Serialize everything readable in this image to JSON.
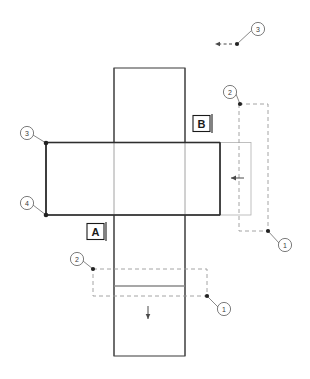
{
  "drawing": {
    "title": "Sheet metal cross flat pattern with bend zones",
    "background_color": "#ffffff",
    "line_color": "#4a4a4a",
    "heavy_line_color": "#2e2e2e",
    "light_line_color": "#a8a8a8",
    "dashed_line_color": "#9a9a9a",
    "balloon_color": "#5a5a5a",
    "width": 310,
    "height": 379
  },
  "datums": [
    {
      "id": "datum-a",
      "label": "A",
      "x": 96,
      "y": 232
    },
    {
      "id": "datum-b",
      "label": "B",
      "x": 202,
      "y": 124
    }
  ],
  "balloons": [
    {
      "id": "balloon-top-3",
      "label": "3",
      "cx": 258,
      "cy": 29,
      "dot_x": 237,
      "dot_y": 44
    },
    {
      "id": "balloon-right-2",
      "label": "2",
      "cx": 230,
      "cy": 92,
      "dot_x": 240,
      "dot_y": 104
    },
    {
      "id": "balloon-right-1",
      "label": "1",
      "cx": 285,
      "cy": 245,
      "dot_x": 268,
      "dot_y": 231
    },
    {
      "id": "balloon-left-3",
      "label": "3",
      "cx": 27,
      "cy": 133,
      "dot_x": 46,
      "dot_y": 143
    },
    {
      "id": "balloon-left-4",
      "label": "4",
      "cx": 27,
      "cy": 203,
      "dot_x": 46,
      "dot_y": 215
    },
    {
      "id": "balloon-bottom-2",
      "label": "2",
      "cx": 77,
      "cy": 259,
      "dot_x": 93,
      "dot_y": 269
    },
    {
      "id": "balloon-bottom-1",
      "label": "1",
      "cx": 224,
      "cy": 309,
      "dot_x": 207,
      "dot_y": 296
    }
  ],
  "shapes": {
    "vertical_strip": {
      "x": 114,
      "y": 68,
      "width": 71,
      "height": 288
    },
    "horizontal_flange": {
      "x": 46,
      "y": 142,
      "width": 174,
      "height": 73
    },
    "right_extension": {
      "x": 220,
      "y": 142,
      "width": 31,
      "height": 73
    },
    "right_bend_zone": {
      "x": 239,
      "y": 104,
      "width": 29,
      "height": 127
    },
    "bottom_bend_zone": {
      "x": 93,
      "y": 269,
      "width": 114,
      "height": 27
    },
    "bottom_bend_line_y": 286
  },
  "arrows": [
    {
      "id": "arrow-left-bend",
      "direction": "left",
      "x": 238,
      "y": 178
    },
    {
      "id": "arrow-down-bend",
      "direction": "down",
      "x": 148,
      "y": 313
    },
    {
      "id": "arrow-top-dashed",
      "direction": "left",
      "x": 221,
      "y": 44
    }
  ]
}
